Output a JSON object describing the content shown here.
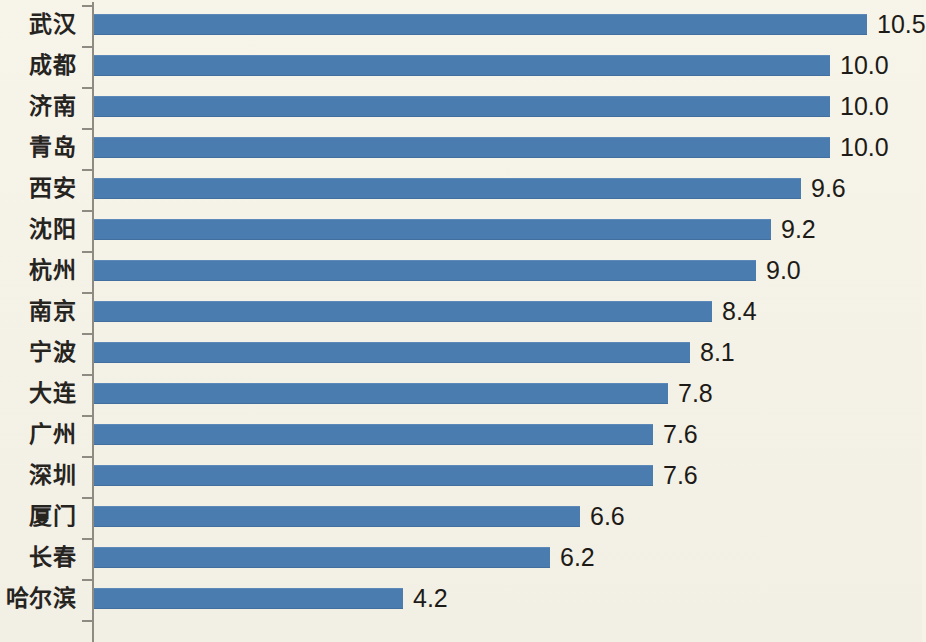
{
  "chart_data": {
    "type": "bar",
    "orientation": "horizontal",
    "title": "",
    "subtitle": "",
    "xlabel": "",
    "ylabel": "",
    "categories": [
      "武汉",
      "成都",
      "济南",
      "青岛",
      "西安",
      "沈阳",
      "杭州",
      "南京",
      "宁波",
      "大连",
      "广州",
      "深圳",
      "厦门",
      "长春",
      "哈尔滨"
    ],
    "values": [
      10.5,
      10.0,
      10.0,
      10.0,
      9.6,
      9.2,
      9.0,
      8.4,
      8.1,
      7.8,
      7.6,
      7.6,
      6.6,
      6.2,
      4.2
    ],
    "value_labels": [
      "10.5",
      "10.0",
      "10.0",
      "10.0",
      "9.6",
      "9.2",
      "9.0",
      "8.4",
      "8.1",
      "7.8",
      "7.6",
      "7.6",
      "6.6",
      "6.2",
      "4.2"
    ],
    "xlim": [
      0,
      10.5
    ],
    "grid": false,
    "legend": null,
    "series": [
      {
        "name": "",
        "color": "#4a7cb0",
        "values": [
          10.5,
          10.0,
          10.0,
          10.0,
          9.6,
          9.2,
          9.0,
          8.4,
          8.1,
          7.8,
          7.6,
          7.6,
          6.6,
          6.2,
          4.2
        ]
      }
    ],
    "colors": {
      "bar": "#4a7cb0",
      "background": "#f6f3e9",
      "axis": "#8d8b82",
      "label_text": "#26241f",
      "value_text": "#1d1b17"
    }
  }
}
